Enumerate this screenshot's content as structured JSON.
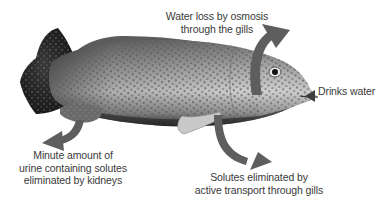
{
  "diagram": {
    "colors": {
      "arrow": "#5e5e5e",
      "text": "#3a3a3a",
      "fish_dark": "#222222",
      "fish_mid": "#8a8a8a",
      "fish_light": "#d6d6d6",
      "background": "#ffffff"
    },
    "labels": {
      "water_loss": [
        "Water loss by osmosis",
        "through the gills"
      ],
      "drinks": [
        "Drinks water"
      ],
      "urine": [
        "Minute amount of",
        "urine containing solutes",
        "eliminated by kidneys"
      ],
      "solutes": [
        "Solutes eliminated by",
        "active transport through gills"
      ]
    },
    "arrows": [
      {
        "id": "water-loss",
        "direction": "outward-up",
        "from": "gills",
        "points_to": "water_loss"
      },
      {
        "id": "drinks",
        "direction": "inward",
        "from": "drinks",
        "points_to": "mouth"
      },
      {
        "id": "urine",
        "direction": "outward-down-left",
        "from": "kidney/anal region",
        "points_to": "urine"
      },
      {
        "id": "solutes",
        "direction": "outward-down-right",
        "from": "gills",
        "points_to": "solutes"
      }
    ]
  }
}
